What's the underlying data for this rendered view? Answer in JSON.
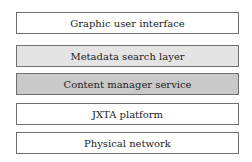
{
  "diagram": {
    "type": "layered-stack",
    "layers": [
      {
        "label": "Graphic user interface",
        "fill": "#ffffff"
      },
      {
        "label": "Metadata search layer",
        "fill": "#e4e4e4"
      },
      {
        "label": "Content manager service",
        "fill": "#c9c9c9"
      },
      {
        "label": "JXTA platform",
        "fill": "#ffffff"
      },
      {
        "label": "Physical network",
        "fill": "#ffffff"
      }
    ]
  }
}
